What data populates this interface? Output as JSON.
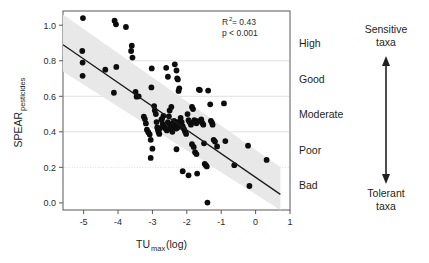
{
  "figure": {
    "background": "#ffffff",
    "plot_frame_color": "#58595b",
    "point_color": "#0d0d0d",
    "band_color": "#e8e8e8",
    "trend_color": "#1a1a1a",
    "grid_color": "#d9d9d9"
  },
  "annotations": {
    "r_squared_prefix": "R",
    "r_squared_sup": "2",
    "r_squared_value": " = 0.43",
    "p_value": "p < 0.001"
  },
  "quality_classes": [
    {
      "label": "High",
      "y_center": 0.9
    },
    {
      "label": "Good",
      "y_center": 0.7
    },
    {
      "label": "Moderate",
      "y_center": 0.5
    },
    {
      "label": "Poor",
      "y_center": 0.3
    },
    {
      "label": "Bad",
      "y_center": 0.1
    }
  ],
  "gradient": {
    "top_line1": "Sensitive",
    "top_line2": "taxa",
    "bottom_line1": "Tolerant",
    "bottom_line2": "taxa"
  },
  "chart_data": {
    "type": "scatter",
    "title": "",
    "xlabel_main": "TU",
    "xlabel_sub": "max",
    "xlabel_tail": " (log)",
    "ylabel_main": "SPEAR",
    "ylabel_sub": "pesticides",
    "xlim": [
      -5.6,
      1.0
    ],
    "ylim": [
      -0.04,
      1.08
    ],
    "xticks": [
      -5,
      -4,
      -3,
      -2,
      -1,
      0,
      1
    ],
    "xtick_labels": [
      "-5",
      "-4",
      "-3",
      "-2",
      "-1",
      "0",
      "1"
    ],
    "yticks": [
      0.0,
      0.2,
      0.4,
      0.6,
      0.8,
      1.0
    ],
    "ytick_labels": [
      "0.0",
      "0.2",
      "0.4",
      "0.6",
      "0.8",
      "1.0"
    ],
    "gridlines_y": [
      0.2,
      0.4,
      0.6,
      0.8
    ],
    "gridline_styles": [
      "dotted",
      "solid",
      "solid",
      "solid"
    ],
    "legend": "none",
    "trendline": {
      "x_start": -5.6,
      "y_start": 0.89,
      "x_end": 0.72,
      "y_end": 0.048,
      "slope": -0.133,
      "intercept": 0.143
    },
    "confidence_band": {
      "upper": [
        [
          -5.6,
          1.06
        ],
        [
          0.72,
          0.2
        ]
      ],
      "lower": [
        [
          -5.6,
          0.74
        ],
        [
          0.72,
          -0.04
        ]
      ]
    },
    "points": [
      [
        -5.02,
        1.04
      ],
      [
        -5.04,
        0.855
      ],
      [
        -5.03,
        0.79
      ],
      [
        -5.03,
        0.715
      ],
      [
        -4.37,
        0.75
      ],
      [
        -4.1,
        1.025
      ],
      [
        -4.06,
        1.005
      ],
      [
        -4.05,
        0.765
      ],
      [
        -4.12,
        0.62
      ],
      [
        -3.77,
        0.99
      ],
      [
        -3.62,
        0.855
      ],
      [
        -3.58,
        0.818
      ],
      [
        -3.49,
        0.625
      ],
      [
        -3.46,
        0.598
      ],
      [
        -3.4,
        0.6
      ],
      [
        -3.6,
        0.885
      ],
      [
        -3.25,
        0.485
      ],
      [
        -3.22,
        0.472
      ],
      [
        -3.19,
        0.447
      ],
      [
        -3.16,
        0.412
      ],
      [
        -3.12,
        0.398
      ],
      [
        -3.08,
        0.385
      ],
      [
        -3.05,
        0.355
      ],
      [
        -3.03,
        0.65
      ],
      [
        -3.02,
        0.757
      ],
      [
        -3.0,
        0.305
      ],
      [
        -3.05,
        0.253
      ],
      [
        -2.95,
        0.545
      ],
      [
        -2.93,
        0.52
      ],
      [
        -2.9,
        0.5
      ],
      [
        -2.88,
        0.455
      ],
      [
        -2.86,
        0.425
      ],
      [
        -2.84,
        0.41
      ],
      [
        -2.82,
        0.398
      ],
      [
        -2.8,
        0.388
      ],
      [
        -2.78,
        0.42
      ],
      [
        -2.74,
        0.468
      ],
      [
        -2.7,
        0.445
      ],
      [
        -2.66,
        0.43
      ],
      [
        -2.62,
        0.418
      ],
      [
        -2.58,
        0.408
      ],
      [
        -2.55,
        0.455
      ],
      [
        -2.52,
        0.487
      ],
      [
        -2.5,
        0.442
      ],
      [
        -2.48,
        0.425
      ],
      [
        -2.45,
        0.415
      ],
      [
        -2.42,
        0.4
      ],
      [
        -2.4,
        0.448
      ],
      [
        -2.37,
        0.462
      ],
      [
        -2.34,
        0.432
      ],
      [
        -2.3,
        0.418
      ],
      [
        -2.27,
        0.455
      ],
      [
        -2.24,
        0.44
      ],
      [
        -2.21,
        0.428
      ],
      [
        -2.18,
        0.478
      ],
      [
        -2.15,
        0.455
      ],
      [
        -2.12,
        0.432
      ],
      [
        -2.08,
        0.415
      ],
      [
        -2.05,
        0.4
      ],
      [
        -2.02,
        0.388
      ],
      [
        -2.35,
        0.78
      ],
      [
        -2.3,
        0.745
      ],
      [
        -2.28,
        0.7
      ],
      [
        -2.26,
        0.695
      ],
      [
        -2.24,
        0.63
      ],
      [
        -2.22,
        0.645
      ],
      [
        -2.6,
        0.76
      ],
      [
        -2.55,
        0.71
      ],
      [
        -1.98,
        0.5
      ],
      [
        -1.95,
        0.465
      ],
      [
        -1.92,
        0.455
      ],
      [
        -1.88,
        0.44
      ],
      [
        -1.85,
        0.54
      ],
      [
        -1.82,
        0.528
      ],
      [
        -1.78,
        0.465
      ],
      [
        -1.75,
        0.452
      ],
      [
        -1.72,
        0.448
      ],
      [
        -1.68,
        0.46
      ],
      [
        -1.65,
        0.638
      ],
      [
        -1.62,
        0.635
      ],
      [
        -1.58,
        0.47
      ],
      [
        -1.55,
        0.45
      ],
      [
        -1.52,
        0.44
      ],
      [
        -1.5,
        0.335
      ],
      [
        -1.48,
        0.22
      ],
      [
        -1.45,
        0.212
      ],
      [
        -1.42,
        0.205
      ],
      [
        -1.4,
        0.002
      ],
      [
        -1.85,
        0.33
      ],
      [
        -1.8,
        0.315
      ],
      [
        -1.76,
        0.285
      ],
      [
        -1.72,
        0.275
      ],
      [
        -1.7,
        0.165
      ],
      [
        -1.95,
        0.155
      ],
      [
        -2.12,
        0.178
      ],
      [
        -2.3,
        0.302
      ],
      [
        -1.38,
        0.632
      ],
      [
        -1.32,
        0.555
      ],
      [
        -1.3,
        0.462
      ],
      [
        -1.27,
        0.452
      ],
      [
        -1.25,
        0.44
      ],
      [
        -1.22,
        0.355
      ],
      [
        -1.18,
        0.345
      ],
      [
        -1.12,
        0.318
      ],
      [
        -0.92,
        0.56
      ],
      [
        -0.88,
        0.348
      ],
      [
        -0.62,
        0.212
      ],
      [
        -0.22,
        0.322
      ],
      [
        -0.18,
        0.095
      ],
      [
        0.32,
        0.242
      ],
      [
        -2.5,
        0.52
      ],
      [
        -2.45,
        0.54
      ],
      [
        -2.68,
        0.49
      ],
      [
        -2.72,
        0.473
      ]
    ]
  }
}
